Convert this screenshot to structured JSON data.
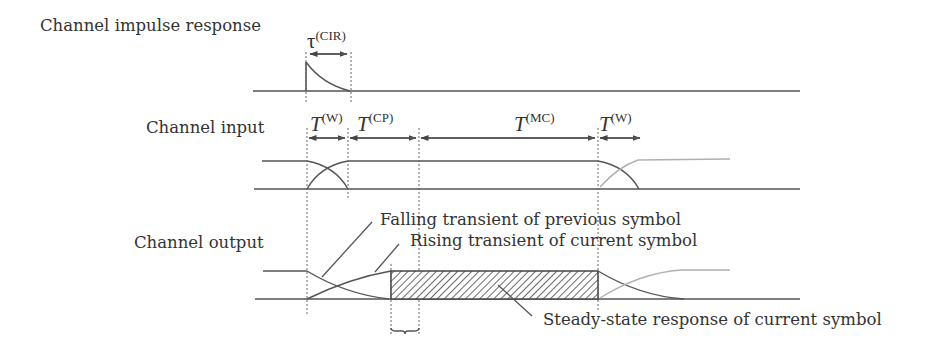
{
  "rows": {
    "cir_label": "Channel impulse response",
    "input_label": "Channel input",
    "output_label": "Channel output"
  },
  "intervals": {
    "cir": {
      "main": "τ",
      "sup": "(CIR)"
    },
    "window1": {
      "main": "T",
      "sup": "(W)"
    },
    "cyclic_prefix": {
      "main": "T",
      "sup": "(CP)"
    },
    "multicarrier": {
      "main": "T",
      "sup": "(MC)"
    },
    "window2": {
      "main": "T",
      "sup": "(W)"
    }
  },
  "annotations": {
    "falling": "Falling transient of previous symbol",
    "rising": "Rising transient of current symbol",
    "steady": "Steady-state response of current symbol"
  },
  "colors": {
    "line": "#555555",
    "next_symbol": "#b0b0b0",
    "text": "#333333"
  }
}
